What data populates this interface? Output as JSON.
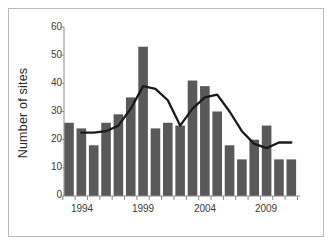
{
  "chart_data": {
    "type": "bar",
    "title": "",
    "xlabel": "",
    "ylabel": "Number of sites",
    "ylim": [
      0,
      60
    ],
    "yticks": [
      0,
      10,
      20,
      30,
      40,
      50,
      60
    ],
    "xticks_labeled": [
      "1994",
      "1999",
      "2004",
      "2009"
    ],
    "grid": false,
    "legend": "none",
    "categories": [
      "1994",
      "1995",
      "1996",
      "1997",
      "1998",
      "1999",
      "2000",
      "2001",
      "2002",
      "2003",
      "2004",
      "2005",
      "2006",
      "2007",
      "2008",
      "2009",
      "2010",
      "2011",
      "2012"
    ],
    "series": [
      {
        "name": "Number of sites",
        "type": "bar",
        "color": "#595959",
        "values": [
          26,
          24,
          18,
          26,
          29,
          35,
          53,
          24,
          26,
          25,
          41,
          39,
          30,
          18,
          13,
          20,
          25,
          13,
          13
        ]
      },
      {
        "name": "Moving average",
        "type": "line",
        "color": "#1a1a1a",
        "x": [
          "1995",
          "1996",
          "1997",
          "1998",
          "1999",
          "2000",
          "2001",
          "2002",
          "2003",
          "2004",
          "2005",
          "2006",
          "2007",
          "2008",
          "2009",
          "2010",
          "2011",
          "2012"
        ],
        "values": [
          22.5,
          22.5,
          23,
          25,
          31,
          39,
          38,
          34,
          25,
          31,
          35,
          36,
          30,
          23,
          18.5,
          17,
          19,
          19
        ]
      }
    ]
  },
  "axis": {
    "y_label_text": "Number of sites",
    "y_tick_0": "0",
    "y_tick_10": "10",
    "y_tick_20": "20",
    "y_tick_30": "30",
    "y_tick_40": "40",
    "y_tick_50": "50",
    "y_tick_60": "60",
    "x_tick_1994": "1994",
    "x_tick_1999": "1999",
    "x_tick_2004": "2004",
    "x_tick_2009": "2009"
  },
  "colors": {
    "bar_fill": "#595959",
    "line_stroke": "#1a1a1a",
    "axis_stroke": "#8a8a8a",
    "frame_stroke": "#b9b9b9",
    "text": "#3a3a3a"
  }
}
